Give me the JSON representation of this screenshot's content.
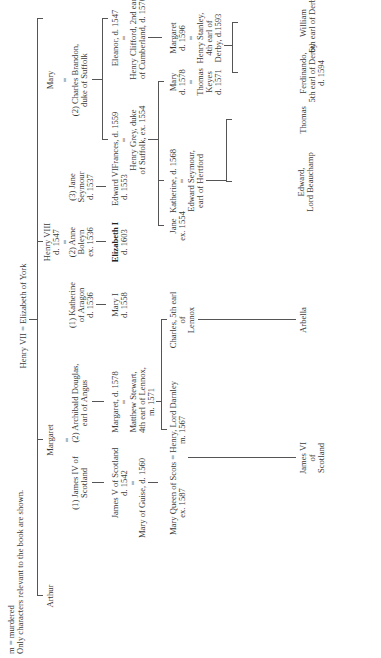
{
  "legend": {
    "line1": "m = murdered",
    "line2": "Only characters relevant to the book are shown."
  },
  "root": {
    "label": "Henry VII = Elizabeth of York"
  },
  "gen1": {
    "arthur": "Arthur",
    "margaret": "Margaret",
    "henry8_name": "Henry VIII",
    "henry8_death": "d. 1547",
    "mary": "Mary"
  },
  "margaret_spouses": {
    "eq": "=",
    "james4_l1": "(1) James IV of",
    "james4_l2": "Scotland",
    "archibald_l1": "(2) Archibald Douglas,",
    "archibald_l2": "earl of Angus"
  },
  "henry8_spouses": {
    "eq": "=",
    "katherine_l1": "(1) Katherine",
    "katherine_l2": "of Aragon",
    "katherine_l3": "d. 1536",
    "anne_l1": "(2) Anne",
    "anne_l2": "Boleyn",
    "anne_l3": "ex. 1536",
    "jane_l1": "(3) Jane",
    "jane_l2": "Seymour",
    "jane_l3": "d. 1537"
  },
  "mary_spouse": {
    "eq": "=",
    "charles_l1": "(2) Charles Brandon,",
    "charles_l2": "duke of Suffolk"
  },
  "gen2": {
    "james5_l1": "James V of Scotland",
    "james5_l2": "d. 1542",
    "james5_eq": "=",
    "mary_guise": "Mary of Guise, d. 1560",
    "margaret_d_l1": "Margaret, d. 1578",
    "margaret_d_eq": "=",
    "matthew_l1": "Matthew Stewart,",
    "matthew_l2": "4th earl of Lennox,",
    "matthew_l3": "m. 1571",
    "mary1_l1": "Mary I",
    "mary1_l2": "d. 1558",
    "elizabeth1_l1": "Elizabeth I",
    "elizabeth1_l2": "d. 1603",
    "edward6_l1": "Edward VI",
    "edward6_l2": "d. 1553",
    "frances_l1": "Frances, d. 1559",
    "frances_eq": "=",
    "henry_grey_l1": "Henry Grey, duke",
    "henry_grey_l2": "of Suffolk, ex. 1554",
    "eleanor_l1": "Eleanor, d. 1547",
    "eleanor_eq": "=",
    "clifford_l1": "Henry Clifford, 2nd earl",
    "clifford_l2": "of Cumberland, d. 1570"
  },
  "gen3": {
    "mqs_l1": "Mary Queen of Scots = Henry, Lord Darnley",
    "mqs_l2a": "ex. 1587",
    "mqs_l2b": "m. 1567",
    "charles_l1": "Charles, 5th earl",
    "charles_l2": "of",
    "charles_l3": "Lennox",
    "jane_l1": "Jane",
    "jane_l2": "ex. 1554",
    "katherine_l1": "Katherine, d. 1568",
    "katherine_eq": "=",
    "edward_seymour_l1": "Edward Seymour,",
    "edward_seymour_l2": "earl of Hertford",
    "mary_g_l1": "Mary",
    "mary_g_l2": "d. 1578",
    "mary_g_eq": "=",
    "keyes_l1": "Thomas",
    "keyes_l2": "Keyes",
    "keyes_l3": "d. 1571",
    "margaret_c_l1": "Margaret",
    "margaret_c_l2": "d. 1596",
    "margaret_c_eq": "=",
    "stanley_l1": "Henry Stanley,",
    "stanley_l2": "4th earl of",
    "stanley_l3": "Derby, d.1593"
  },
  "gen4": {
    "james6_l1": "James VI",
    "james6_l2": "of",
    "james6_l3": "Scotland",
    "arbella": "Arbella",
    "edward_l1": "Edward,",
    "edward_l2": "Lord Beauchamp",
    "thomas": "Thomas",
    "ferdinando_l1": "Ferdinando,",
    "ferdinando_l2": "5th earl of Derby",
    "ferdinando_l3": "d. 1594",
    "william_l1": "William",
    "william_l2": "6th earl of Derby"
  }
}
